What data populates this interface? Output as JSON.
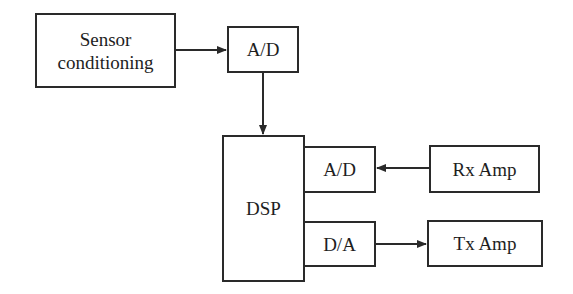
{
  "diagram": {
    "type": "block-diagram",
    "blocks": {
      "sensor_conditioning": "Sensor\nconditioning",
      "ad_top": "A/D",
      "dsp": "DSP",
      "ad_rx": "A/D",
      "rx_amp": "Rx Amp",
      "da_tx": "D/A",
      "tx_amp": "Tx Amp"
    },
    "connections": [
      {
        "from": "Sensor conditioning",
        "to": "A/D (top)"
      },
      {
        "from": "A/D (top)",
        "to": "DSP"
      },
      {
        "from": "Rx Amp",
        "to": "A/D (DSP)"
      },
      {
        "from": "D/A (DSP)",
        "to": "Tx Amp"
      }
    ],
    "colors": {
      "line": "#2a2a2a",
      "background": "#ffffff"
    }
  }
}
